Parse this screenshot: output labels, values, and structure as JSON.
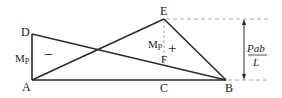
{
  "points": {
    "A": "A",
    "B": "B",
    "C": "C",
    "D": "D",
    "E": "E",
    "F": "F"
  },
  "labels": {
    "mp_left": "M",
    "mp_left_sub": "P",
    "mp_right": "M",
    "mp_right_sub": "P",
    "minus_sign": "−",
    "plus_sign": "+",
    "dimension_numerator": "Pab",
    "dimension_denominator": "L"
  },
  "colors": {
    "line": "#2a2a2a",
    "dashed": "#aaaaaa"
  }
}
